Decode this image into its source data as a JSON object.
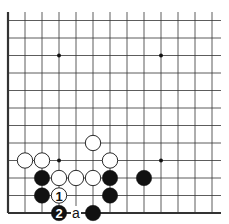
{
  "diagram": {
    "type": "go-board-fragment",
    "colors": {
      "background": "#ffffff",
      "line": "#333333",
      "black": "#111111",
      "white": "#ffffff"
    },
    "grid": {
      "cols": 13,
      "rows": 12,
      "left_edge": true,
      "bottom_edge": true
    },
    "star_points": [
      [
        3,
        2
      ],
      [
        9,
        2
      ],
      [
        3,
        8
      ],
      [
        9,
        8
      ]
    ],
    "stones": [
      {
        "col": 1,
        "row": 8,
        "color": "white",
        "label": ""
      },
      {
        "col": 2,
        "row": 8,
        "color": "white",
        "label": ""
      },
      {
        "col": 5,
        "row": 7,
        "color": "white",
        "label": ""
      },
      {
        "col": 6,
        "row": 8,
        "color": "white",
        "label": ""
      },
      {
        "col": 2,
        "row": 9,
        "color": "black",
        "label": ""
      },
      {
        "col": 3,
        "row": 9,
        "color": "white",
        "label": ""
      },
      {
        "col": 4,
        "row": 9,
        "color": "white",
        "label": ""
      },
      {
        "col": 5,
        "row": 9,
        "color": "white",
        "label": ""
      },
      {
        "col": 6,
        "row": 9,
        "color": "black",
        "label": ""
      },
      {
        "col": 8,
        "row": 9,
        "color": "black",
        "label": ""
      },
      {
        "col": 2,
        "row": 10,
        "color": "black",
        "label": ""
      },
      {
        "col": 3,
        "row": 10,
        "color": "white",
        "label": "1"
      },
      {
        "col": 6,
        "row": 10,
        "color": "black",
        "label": ""
      },
      {
        "col": 3,
        "row": 11,
        "color": "black",
        "label": "2"
      },
      {
        "col": 5,
        "row": 11,
        "color": "black",
        "label": ""
      }
    ],
    "markers": [
      {
        "col": 4,
        "row": 11,
        "label": "a"
      }
    ]
  }
}
